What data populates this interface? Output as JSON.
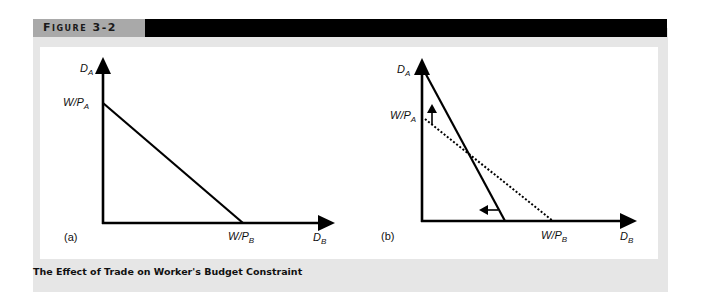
{
  "header": {
    "figure_label": "Figure 3-2",
    "label_bg": "#a9a9a9",
    "bar_color": "#000000"
  },
  "caption": "The Effect of Trade on Worker's Budget Constraint",
  "panels": [
    {
      "id": "a",
      "panel_label": "(a)",
      "y_axis_label": "D",
      "y_axis_sub": "A",
      "x_axis_label": "D",
      "x_axis_sub": "B",
      "y_intercept_label": "W/P",
      "y_intercept_sub": "A",
      "x_intercept_label": "W/P",
      "x_intercept_sub": "B",
      "lines": [
        {
          "name": "budget-constraint",
          "style": "solid",
          "from": "W/P_A on D_A axis",
          "to": "W/P_B on D_B axis"
        }
      ]
    },
    {
      "id": "b",
      "panel_label": "(b)",
      "y_axis_label": "D",
      "y_axis_sub": "A",
      "x_axis_label": "D",
      "x_axis_sub": "B",
      "y_intercept_label": "W/P",
      "y_intercept_sub": "A",
      "x_intercept_label": "W/P",
      "x_intercept_sub": "B",
      "lines": [
        {
          "name": "original-budget-constraint",
          "style": "dotted",
          "from": "W/P_A on D_A axis",
          "to": "W/P_B on D_B axis"
        },
        {
          "name": "post-trade-budget-constraint",
          "style": "solid",
          "from": "top of D_A axis",
          "to": "inside W/P_B on D_B axis"
        }
      ],
      "arrows": [
        {
          "name": "shift-up-arrow",
          "direction": "up",
          "meaning": "D_A intercept rises"
        },
        {
          "name": "shift-left-arrow",
          "direction": "left",
          "meaning": "D_B intercept falls"
        }
      ]
    }
  ]
}
